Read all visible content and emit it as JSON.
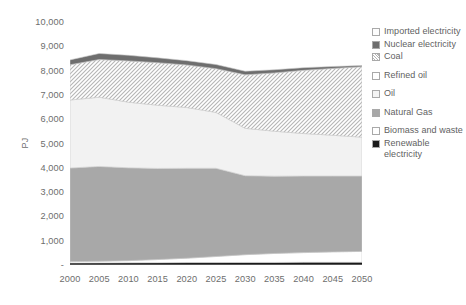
{
  "chart_data": {
    "type": "area",
    "title": "",
    "xlabel": "",
    "ylabel": "PJ",
    "x": [
      2000,
      2005,
      2010,
      2015,
      2020,
      2025,
      2030,
      2035,
      2040,
      2045,
      2050
    ],
    "xtick_labels": [
      "2000",
      "2005",
      "2010",
      "2015",
      "2020",
      "2025",
      "2030",
      "2035",
      "2040",
      "2045",
      "2050"
    ],
    "ylim": [
      0,
      10000
    ],
    "ytick_values": [
      0,
      1000,
      2000,
      3000,
      4000,
      5000,
      6000,
      7000,
      8000,
      9000,
      10000
    ],
    "ytick_labels": [
      "-",
      "1,000",
      "2,000",
      "3,000",
      "4,000",
      "5,000",
      "6,000",
      "7,000",
      "8,000",
      "9,000",
      "10,000"
    ],
    "grid": false,
    "stacked": true,
    "legend_position": "right",
    "series": [
      {
        "name": "Renewable electricity",
        "values": [
          80,
          85,
          90,
          95,
          100,
          100,
          105,
          105,
          110,
          110,
          110
        ]
      },
      {
        "name": "Biomass and waste",
        "values": [
          60,
          70,
          90,
          130,
          180,
          250,
          320,
          370,
          400,
          430,
          450
        ]
      },
      {
        "name": "Natural Gas",
        "values": [
          3850,
          3900,
          3820,
          3750,
          3700,
          3630,
          3250,
          3180,
          3150,
          3120,
          3100
        ]
      },
      {
        "name": "Oil",
        "values": [
          2800,
          2850,
          2700,
          2600,
          2500,
          2300,
          1950,
          1850,
          1750,
          1680,
          1600
        ]
      },
      {
        "name": "Refined oil",
        "values": [
          0,
          0,
          0,
          0,
          0,
          0,
          0,
          0,
          0,
          0,
          0
        ]
      },
      {
        "name": "Coal",
        "values": [
          1450,
          1550,
          1700,
          1750,
          1750,
          1800,
          2200,
          2400,
          2600,
          2750,
          2900
        ]
      },
      {
        "name": "Nuclear electricity",
        "values": [
          200,
          250,
          230,
          200,
          180,
          170,
          150,
          130,
          110,
          80,
          50
        ]
      },
      {
        "name": "Imported electricity",
        "values": [
          0,
          0,
          0,
          0,
          0,
          0,
          0,
          0,
          0,
          0,
          0
        ]
      }
    ],
    "series_totals": [
      8440,
      8705,
      8630,
      8525,
      8410,
      8250,
      7975,
      8035,
      8120,
      8170,
      8210
    ]
  },
  "legend": {
    "items": [
      {
        "label": "Imported electricity",
        "swatch": "legend-swatch-imported-electricity",
        "fill": "#fdfdfd",
        "gap_after": false
      },
      {
        "label": "Nuclear electricity",
        "swatch": "legend-swatch-nuclear-electricity",
        "fill": "#6e6e6e",
        "gap_after": false
      },
      {
        "label": "Coal",
        "swatch": "legend-swatch-coal",
        "fill": "hatch",
        "gap_after": true
      },
      {
        "label": "Refined oil",
        "swatch": "legend-swatch-refined-oil",
        "fill": "#ffffff",
        "gap_after": true
      },
      {
        "label": "Oil",
        "swatch": "legend-swatch-oil",
        "fill": "#f4f4f4",
        "gap_after": true
      },
      {
        "label": "Natural Gas",
        "swatch": "legend-swatch-natural-gas",
        "fill": "#a8a8a8",
        "gap_after": true
      },
      {
        "label": "Biomass and waste",
        "swatch": "legend-swatch-biomass-and-waste",
        "fill": "#ffffff",
        "gap_after": false
      },
      {
        "label": "Renewable electricity",
        "swatch": "legend-swatch-renewable-electricity",
        "fill": "#1a1a1a",
        "gap_after": false
      }
    ]
  },
  "colors": {
    "renewable_electricity": "#1a1a1a",
    "biomass_and_waste": "#ffffff",
    "natural_gas": "#a8a8a8",
    "oil": "#f2f2f2",
    "refined_oil": "#ffffff",
    "coal": "#d9d9d9",
    "nuclear_electricity": "#6e6e6e",
    "imported_electricity": "#fdfdfd",
    "axis_text": "#6d6d6d",
    "axis_line": "#b0b0b0"
  }
}
